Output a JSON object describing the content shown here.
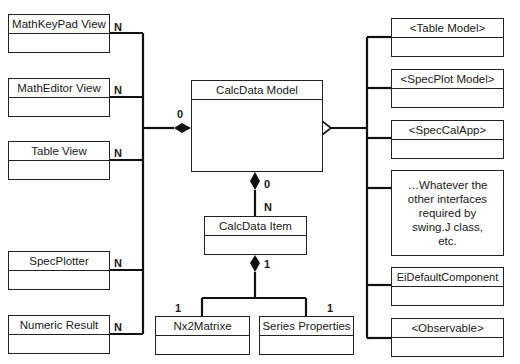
{
  "diagram": {
    "type": "uml-class-diagram",
    "center": {
      "name": "CalcData Model"
    },
    "left_classes": [
      {
        "name": "MathKeyPad View",
        "multiplicity": "N"
      },
      {
        "name": "MathEditor View",
        "multiplicity": "N"
      },
      {
        "name": "Table View",
        "multiplicity": "N"
      },
      {
        "name": "SpecPlotter",
        "multiplicity": "N"
      },
      {
        "name": "Numeric Result",
        "multiplicity": "N"
      }
    ],
    "left_aggregation_multiplicity": "0",
    "right_classes": [
      {
        "name": "<Table Model>"
      },
      {
        "name": "<SpecPlot Model>"
      },
      {
        "name": "<SpecCalApp>"
      },
      {
        "name": "EiDefaultComponent"
      },
      {
        "name": "<Observable>"
      }
    ],
    "right_note": "…Whatever the other interfaces required by swing.J class, etc.",
    "item": {
      "name": "CalcData Item",
      "model_side_multiplicity": "0",
      "item_side_multiplicity": "N",
      "composition_multiplicity": "1"
    },
    "children": [
      {
        "name": "Nx2Matrixe",
        "multiplicity": "1"
      },
      {
        "name": "Series Properties",
        "multiplicity": "1"
      }
    ]
  }
}
